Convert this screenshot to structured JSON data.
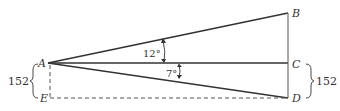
{
  "diagram": {
    "points": {
      "A": "A",
      "B": "B",
      "C": "C",
      "D": "D",
      "E": "E"
    },
    "angles": {
      "upper": "12°",
      "lower": "7°"
    },
    "dimensions": {
      "left_height": "152",
      "right_height": "152"
    },
    "colors": {
      "line": "#333333",
      "background": "#ffffff"
    }
  }
}
